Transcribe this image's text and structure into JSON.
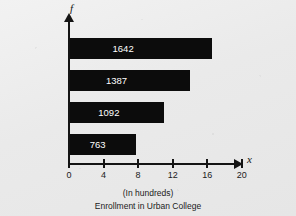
{
  "chart_data": {
    "type": "bar",
    "orientation": "horizontal",
    "title": "Enrollment in Urban College",
    "subtitle": "(In hundreds)",
    "xlabel": "x",
    "ylabel": "f",
    "categories": [
      "Freshmen",
      "Sophomores",
      "Juniors",
      "Seniors"
    ],
    "values": [
      16.42,
      13.87,
      10.92,
      7.63
    ],
    "data_labels": [
      "1642",
      "1387",
      "1092",
      "763"
    ],
    "xlim": [
      0,
      22
    ],
    "xticks": [
      0,
      4,
      8,
      12,
      16,
      20
    ],
    "xtick_labels": [
      "0",
      "4",
      "8",
      "12",
      "16",
      "20"
    ],
    "grid": false,
    "legend": false,
    "bar_color": "#0c0c0c",
    "label_color": "#ffffff",
    "axis_color": "#141414",
    "background_color": "#ebebeb"
  },
  "axes": {
    "y_axis_variable": "f",
    "x_axis_variable": "x"
  },
  "captions": {
    "units": "(In hundreds)",
    "title": "Enrollment in Urban College"
  }
}
